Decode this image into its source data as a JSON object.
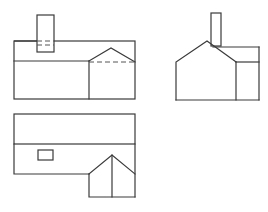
{
  "diagram": {
    "type": "orthographic-projection",
    "views": [
      {
        "name": "front-view",
        "position": "top-left"
      },
      {
        "name": "side-view",
        "position": "top-right"
      },
      {
        "name": "top-view",
        "position": "bottom-left"
      }
    ],
    "colors": {
      "line": "#3a3a3a",
      "hidden_line": "#555555",
      "background": "#ffffff"
    }
  }
}
